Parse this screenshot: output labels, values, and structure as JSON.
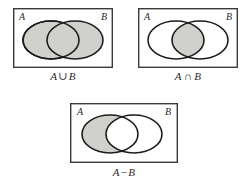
{
  "page": {
    "background_color": "#ffffff",
    "width": 252,
    "height": 191
  },
  "style": {
    "shade_color": "#d0d0cc",
    "stroke_color": "#1c1c1c",
    "frame_color": "#3a3a3a",
    "text_color": "#2b2b2b"
  },
  "diagrams": [
    {
      "id": "union",
      "set_a_label": "A",
      "set_b_label": "B",
      "caption_left": "A",
      "caption_operator": "∪",
      "caption_right": "B",
      "caption_full": "A∪B",
      "shaded_region": "both-circles"
    },
    {
      "id": "intersection",
      "set_a_label": "A",
      "set_b_label": "B",
      "caption_left": "A",
      "caption_operator": "∩",
      "caption_right": "B",
      "caption_full": "A∩B",
      "shaded_region": "overlap-lens"
    },
    {
      "id": "difference",
      "set_a_label": "A",
      "set_b_label": "B",
      "caption_left": "A",
      "caption_operator": "−",
      "caption_right": "B",
      "caption_full": "A−B",
      "shaded_region": "a-minus-b-crescent"
    }
  ]
}
